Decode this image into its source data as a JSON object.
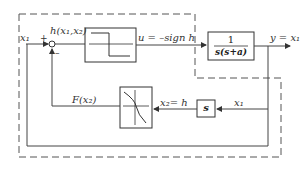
{
  "diagram": {
    "signals": {
      "input": "x₁",
      "plus": "+",
      "minus": "–",
      "switch_fn": "h(x₁,x₂)",
      "control": "u = –sign h",
      "output": "y = x₁",
      "feedback_fn": "F(x₂)",
      "x2": "x₂= h",
      "x1_fb": "x₁"
    },
    "blocks": {
      "plant_num": "1",
      "plant_den": "s(s+a)",
      "diff": "s",
      "relay": "relay",
      "nonlinearity": "nonlinear-function"
    },
    "colors": {
      "line": "#444444",
      "dash": "#555555"
    }
  }
}
